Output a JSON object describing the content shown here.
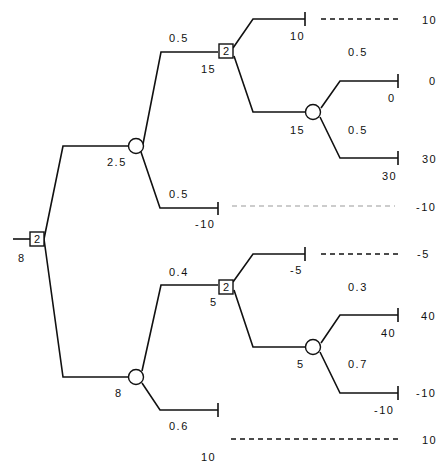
{
  "diagram": {
    "type": "decision-tree",
    "root": {
      "label": "2",
      "value": "8"
    },
    "upper": {
      "chance_value": "2.5",
      "branch_up": {
        "prob": "0.5",
        "decision": {
          "label": "2",
          "value": "15"
        }
      },
      "branch_down": {
        "prob": "0.5",
        "value": "-10",
        "payoff": "-10"
      },
      "decision_children": {
        "top": {
          "value": "10",
          "payoff": "10"
        },
        "chance": {
          "value": "15",
          "up": {
            "prob": "0.5",
            "value": "0",
            "payoff": "0"
          },
          "down": {
            "prob": "0.5",
            "value": "30",
            "payoff": "30"
          }
        }
      }
    },
    "lower": {
      "chance_value": "8",
      "branch_up": {
        "prob": "0.4",
        "decision": {
          "label": "2",
          "value": "5"
        }
      },
      "branch_down": {
        "prob": "0.6",
        "value": "10",
        "payoff": "10"
      },
      "decision_children": {
        "top": {
          "value": "-5",
          "payoff": "-5"
        },
        "chance": {
          "value": "5",
          "up": {
            "prob": "0.3",
            "value": "40",
            "payoff": "40"
          },
          "down": {
            "prob": "0.7",
            "value": "-10",
            "payoff": "-10"
          }
        }
      }
    }
  }
}
